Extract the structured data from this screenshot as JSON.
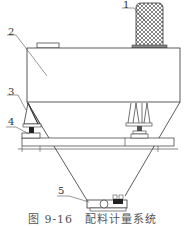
{
  "diagram": {
    "caption": "图 9-16　配料计量系统",
    "labels": [
      {
        "id": "1",
        "text": "1",
        "part": "motor"
      },
      {
        "id": "2",
        "text": "2",
        "part": "hopper-body"
      },
      {
        "id": "3",
        "text": "3",
        "part": "support-bracket"
      },
      {
        "id": "4",
        "text": "4",
        "part": "load-cell"
      },
      {
        "id": "5",
        "text": "5",
        "part": "discharge-gate"
      }
    ],
    "colors": {
      "line": "#333333",
      "background": "#ffffff"
    }
  }
}
